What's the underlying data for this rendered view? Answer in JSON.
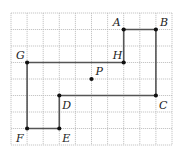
{
  "diagram": {
    "grid": {
      "columns": 10,
      "rows": 8
    },
    "points": [
      {
        "name": "A",
        "col": 7,
        "row": 1,
        "label_pos": "upper-left"
      },
      {
        "name": "B",
        "col": 9,
        "row": 1,
        "label_pos": "upper-right"
      },
      {
        "name": "H",
        "col": 7,
        "row": 3,
        "label_pos": "upper-left"
      },
      {
        "name": "G",
        "col": 1,
        "row": 3,
        "label_pos": "upper-left"
      },
      {
        "name": "P",
        "col": 5,
        "row": 4,
        "label_pos": "upper-right"
      },
      {
        "name": "D",
        "col": 3,
        "row": 5,
        "label_pos": "lower-right"
      },
      {
        "name": "C",
        "col": 9,
        "row": 5,
        "label_pos": "lower-right"
      },
      {
        "name": "E",
        "col": 3,
        "row": 7,
        "label_pos": "lower-right"
      },
      {
        "name": "F",
        "col": 1,
        "row": 7,
        "label_pos": "lower-left"
      }
    ],
    "polygon": [
      "A",
      "B",
      "C",
      "D",
      "E",
      "F",
      "G",
      "H",
      "A"
    ]
  }
}
